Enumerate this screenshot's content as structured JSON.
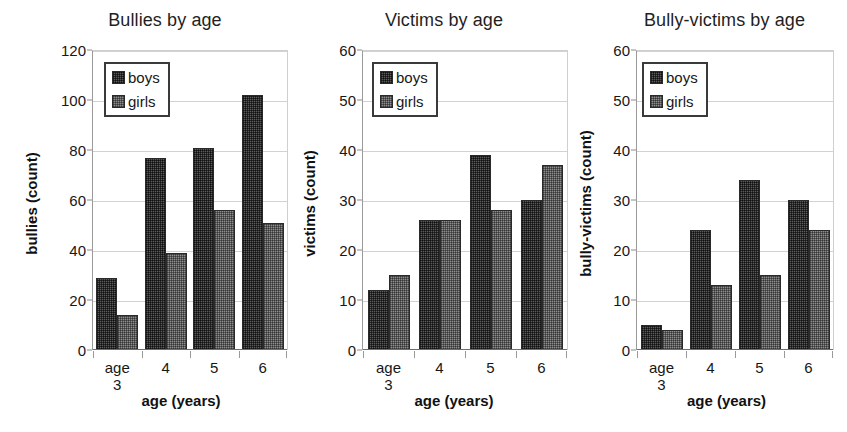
{
  "figure": {
    "background": "#ffffff",
    "series_colors": {
      "boys": "#5b5b5b",
      "girls": "#8e8e8e"
    }
  },
  "charts": [
    {
      "title": "Bullies by age",
      "ylabel": "bullies (count)",
      "xlabel": "age (years)",
      "yticks": [
        "0",
        "20",
        "40",
        "60",
        "80",
        "100",
        "120"
      ],
      "xticklabels": [
        "age\n3",
        "4",
        "5",
        "6"
      ],
      "legend": [
        {
          "label": "boys",
          "swatch": "boys-swatch"
        },
        {
          "label": "girls",
          "swatch": "girls-swatch"
        }
      ]
    },
    {
      "title": "Victims by age",
      "ylabel": "victims (count)",
      "xlabel": "age (years)",
      "yticks": [
        "0",
        "10",
        "20",
        "30",
        "40",
        "50",
        "60"
      ],
      "xticklabels": [
        "age\n3",
        "4",
        "5",
        "6"
      ],
      "legend": [
        {
          "label": "boys",
          "swatch": "boys-swatch"
        },
        {
          "label": "girls",
          "swatch": "girls-swatch"
        }
      ]
    },
    {
      "title": "Bully-victims by age",
      "ylabel": "bully-victims (count)",
      "xlabel": "age (years)",
      "yticks": [
        "0",
        "10",
        "20",
        "30",
        "40",
        "50",
        "60"
      ],
      "xticklabels": [
        "age\n3",
        "4",
        "5",
        "6"
      ],
      "legend": [
        {
          "label": "boys",
          "swatch": "boys-swatch"
        },
        {
          "label": "girls",
          "swatch": "girls-swatch"
        }
      ]
    }
  ],
  "chart_data": [
    {
      "type": "bar",
      "title": "Bullies by age",
      "xlabel": "age (years)",
      "ylabel": "bullies (count)",
      "categories": [
        "age 3",
        "4",
        "5",
        "6"
      ],
      "series": [
        {
          "name": "boys",
          "values": [
            29,
            77,
            81,
            102
          ]
        },
        {
          "name": "girls",
          "values": [
            14,
            39,
            56,
            51
          ]
        }
      ],
      "ylim": [
        0,
        120
      ],
      "ytick_step": 20,
      "grid": true,
      "legend_position": "upper left"
    },
    {
      "type": "bar",
      "title": "Victims by age",
      "xlabel": "age (years)",
      "ylabel": "victims (count)",
      "categories": [
        "age 3",
        "4",
        "5",
        "6"
      ],
      "series": [
        {
          "name": "boys",
          "values": [
            12,
            26,
            39,
            30
          ]
        },
        {
          "name": "girls",
          "values": [
            15,
            26,
            28,
            37
          ]
        }
      ],
      "ylim": [
        0,
        60
      ],
      "ytick_step": 10,
      "grid": true,
      "legend_position": "upper left"
    },
    {
      "type": "bar",
      "title": "Bully-victims by age",
      "xlabel": "age (years)",
      "ylabel": "bully-victims (count)",
      "categories": [
        "age 3",
        "4",
        "5",
        "6"
      ],
      "series": [
        {
          "name": "boys",
          "values": [
            5,
            24,
            34,
            30
          ]
        },
        {
          "name": "girls",
          "values": [
            4,
            13,
            15,
            24
          ]
        }
      ],
      "ylim": [
        0,
        60
      ],
      "ytick_step": 10,
      "grid": true,
      "legend_position": "upper left"
    }
  ]
}
